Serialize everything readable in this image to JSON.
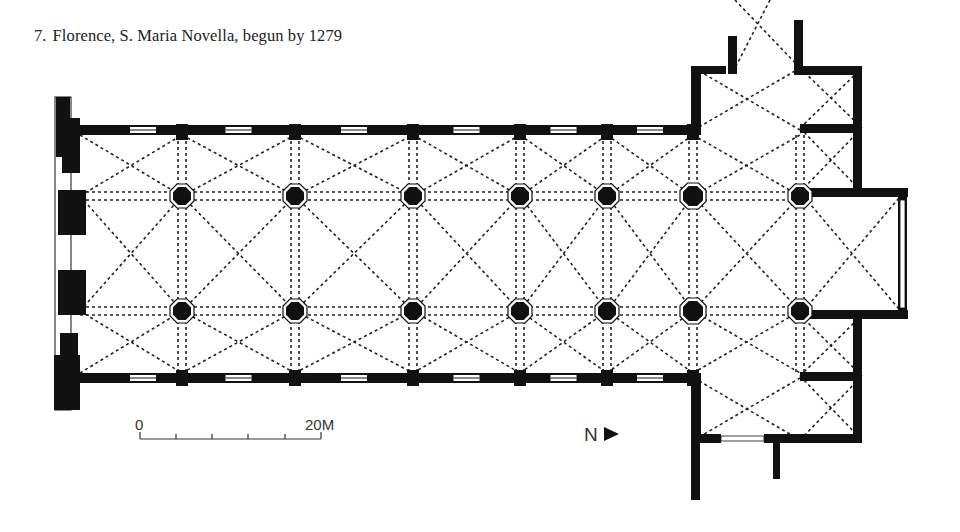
{
  "caption": {
    "number": "7.",
    "text": "Florence, S. Maria Novella, begun by 1279"
  },
  "scale_bar": {
    "start_label": "0",
    "end_label": "20M",
    "ticks": 6
  },
  "north_arrow": {
    "label": "N",
    "glyph": "▶"
  },
  "colors": {
    "ink": "#111111",
    "background": "#ffffff",
    "text": "#222222"
  },
  "plan": {
    "nave_north_wall_y": 130,
    "nave_south_wall_y": 378,
    "west_wall_x": 66,
    "crossing_x": 695,
    "transept_east_x": 800,
    "pier_rows_y": [
      196,
      311
    ],
    "pier_columns_x": [
      182,
      295,
      413,
      520,
      607,
      693,
      800
    ],
    "chancel": {
      "x1": 800,
      "x2": 904,
      "y1": 192,
      "y2": 315
    },
    "transept": {
      "x1": 694,
      "x2": 862,
      "y1": 68,
      "y2": 440
    }
  }
}
